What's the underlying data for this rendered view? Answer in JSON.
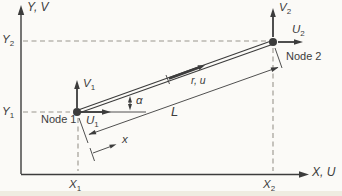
{
  "figure": {
    "name": "bar-element-global-local-axes-diagram",
    "background": "#fbfaf7",
    "ink": "#3c3c3c",
    "dash_color": "#9a958e",
    "edge_band": "#e6e0d0"
  },
  "axes": {
    "y_label": "Y, V",
    "x_label": "X, U"
  },
  "ticks": {
    "y2": {
      "base": "Y",
      "sub": "2"
    },
    "y1": {
      "base": "Y",
      "sub": "1"
    },
    "x1": {
      "base": "X",
      "sub": "1"
    },
    "x2": {
      "base": "X",
      "sub": "2"
    }
  },
  "node1": {
    "label": "Node 1",
    "v": {
      "base": "V",
      "sub": "1"
    },
    "u": {
      "base": "U",
      "sub": "1"
    }
  },
  "node2": {
    "label": "Node 2",
    "v": {
      "base": "V",
      "sub": "2"
    },
    "u": {
      "base": "U",
      "sub": "2"
    }
  },
  "element": {
    "local_label": "r, u",
    "length_label": "L",
    "angle_label": "α",
    "local_axis_label": "x"
  }
}
